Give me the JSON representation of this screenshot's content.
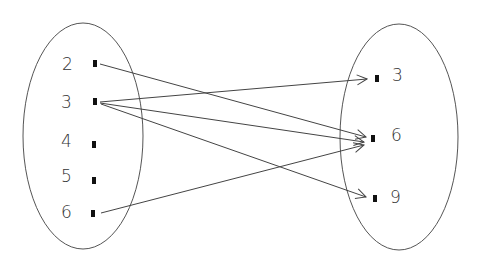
{
  "diagram": {
    "type": "arrow-mapping",
    "domain_set": {
      "elements": [
        {
          "label": "2",
          "y": 64
        },
        {
          "label": "3",
          "y": 102
        },
        {
          "label": "4",
          "y": 145
        },
        {
          "label": "5",
          "y": 181
        },
        {
          "label": "6",
          "y": 214
        }
      ]
    },
    "codomain_set": {
      "elements": [
        {
          "label": "3",
          "y": 78
        },
        {
          "label": "6",
          "y": 139
        },
        {
          "label": "9",
          "y": 198
        }
      ]
    },
    "mappings": [
      {
        "from": "2",
        "to": "6"
      },
      {
        "from": "3",
        "to": "3"
      },
      {
        "from": "3",
        "to": "6"
      },
      {
        "from": "3",
        "to": "9"
      },
      {
        "from": "6",
        "to": "6"
      }
    ],
    "colors": {
      "stroke": "#444444",
      "text": "#333333",
      "dot": "#111111"
    }
  }
}
